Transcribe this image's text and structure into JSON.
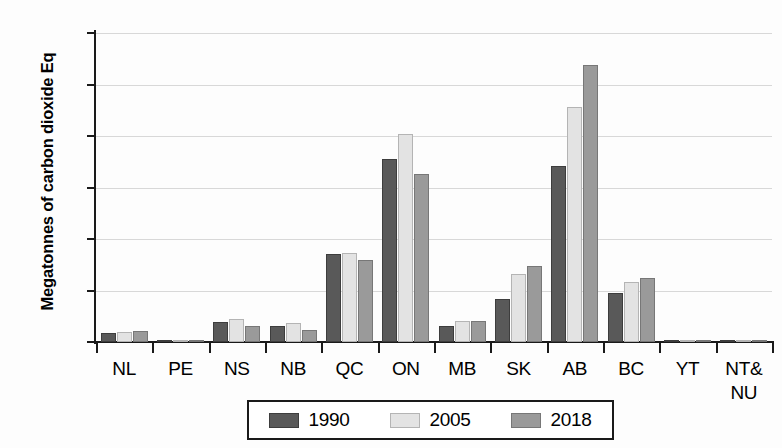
{
  "chart_data": {
    "type": "bar",
    "title": "",
    "xlabel": "",
    "ylabel": "Megatonnes of carbon dioxide Eq",
    "ylim": [
      0,
      300
    ],
    "yticks": [
      0,
      50,
      100,
      150,
      200,
      250,
      300
    ],
    "grid": "horizontal",
    "legend_position": "bottom",
    "categories": [
      "NL",
      "PE",
      "NS",
      "NB",
      "QC",
      "ON",
      "MB",
      "SK",
      "AB",
      "BC",
      "YT",
      "NT&\nNU"
    ],
    "series": [
      {
        "name": "1990",
        "color": "#595959",
        "values": [
          9,
          2,
          19,
          16,
          85,
          178,
          16,
          42,
          171,
          48,
          0.5,
          0.5
        ]
      },
      {
        "name": "2005",
        "color": "#e3e3e3",
        "values": [
          10,
          2,
          22,
          18,
          86,
          202,
          20,
          66,
          228,
          58,
          0.5,
          0.5
        ]
      },
      {
        "name": "2018",
        "color": "#9a9a9a",
        "values": [
          11,
          2,
          16,
          12,
          80,
          163,
          20,
          74,
          269,
          62,
          0.5,
          0.5
        ]
      }
    ]
  },
  "axis": {
    "y_title": "Megatonnes of carbon dioxide Eq",
    "y_tick_labels": [
      "300",
      "250",
      "200",
      "150",
      "100",
      "50",
      "0"
    ],
    "x_tick_labels": [
      {
        "line1": "NL",
        "line2": ""
      },
      {
        "line1": "PE",
        "line2": ""
      },
      {
        "line1": "NS",
        "line2": ""
      },
      {
        "line1": "NB",
        "line2": ""
      },
      {
        "line1": "QC",
        "line2": ""
      },
      {
        "line1": "ON",
        "line2": ""
      },
      {
        "line1": "MB",
        "line2": ""
      },
      {
        "line1": "SK",
        "line2": ""
      },
      {
        "line1": "AB",
        "line2": ""
      },
      {
        "line1": "BC",
        "line2": ""
      },
      {
        "line1": "YT",
        "line2": ""
      },
      {
        "line1": "NT&",
        "line2": "NU"
      }
    ]
  },
  "legend": {
    "entries": [
      {
        "label": "1990",
        "color": "#595959"
      },
      {
        "label": "2005",
        "color": "#e3e3e3"
      },
      {
        "label": "2018",
        "color": "#9a9a9a"
      }
    ]
  }
}
